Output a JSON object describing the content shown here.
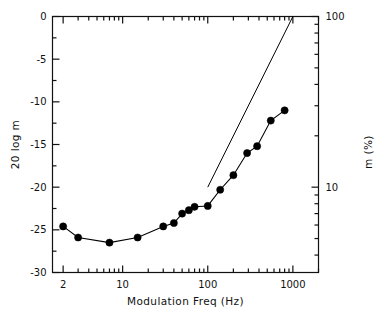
{
  "chart_data": {
    "type": "line",
    "title": "",
    "subtitle": "",
    "xlabel": "Modulation Freq (Hz)",
    "ylabel": "20  log m",
    "y2label": "m (%)",
    "xscale": "log",
    "yscale": "linear",
    "y2scale": "log",
    "xlim": [
      1.5,
      2000
    ],
    "ylim": [
      -30,
      0
    ],
    "y2lim": [
      3.1623,
      100
    ],
    "grid": false,
    "legend": null,
    "xticks": [
      2,
      10,
      100,
      1000
    ],
    "xticklabels": [
      "2",
      "10",
      "100",
      "1000"
    ],
    "yticks": [
      -30,
      -25,
      -20,
      -15,
      -10,
      -5,
      0
    ],
    "yticklabels": [
      "-30",
      "-25",
      "-20",
      "-15",
      "-10",
      "-5",
      "0"
    ],
    "y2ticks": [
      3,
      10,
      100
    ],
    "y2ticklabels": [
      "3",
      "10",
      "100"
    ],
    "series": [
      {
        "name": "modulation-sensitivity",
        "style": "line-with-markers",
        "marker": "filled-circle",
        "color": "#000000",
        "x": [
          2,
          3,
          7,
          15,
          30,
          40,
          50,
          60,
          70,
          100,
          140,
          200,
          290,
          380,
          550,
          800
        ],
        "y": [
          -24.6,
          -25.9,
          -26.5,
          -25.9,
          -24.6,
          -24.2,
          -23.1,
          -22.7,
          -22.3,
          -22.2,
          -20.3,
          -18.6,
          -16.0,
          -15.2,
          -12.2,
          -11.0
        ]
      },
      {
        "name": "reference-slope-line",
        "style": "line",
        "marker": "none",
        "color": "#000000",
        "x": [
          100,
          1000
        ],
        "y": [
          -20,
          0
        ]
      }
    ]
  },
  "axes": {
    "x_label": "Modulation Freq (Hz)",
    "y_left_label": "20  log m",
    "y_right_label": "m (%)"
  }
}
